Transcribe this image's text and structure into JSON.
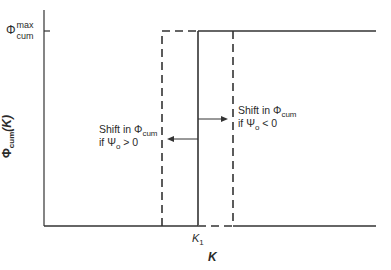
{
  "diagram": {
    "y_axis_label": {
      "symbol": "Φ",
      "subscript": "cum",
      "arg": "(K)"
    },
    "y_tick_label": {
      "symbol": "Φ",
      "superscript": "max",
      "subscript": "cum"
    },
    "x_axis_label": "K",
    "x_tick_label": {
      "symbol": "K",
      "subscript": "1"
    },
    "annotation_left": {
      "line1_prefix": "Shift in Φ",
      "line1_sub": "cum",
      "line2_prefix": "if Ψ",
      "line2_sub": "o",
      "line2_suffix": " > 0"
    },
    "annotation_right": {
      "line1_prefix": "Shift in Φ",
      "line1_sub": "cum",
      "line2_prefix": "if Ψ",
      "line2_sub": "o",
      "line2_suffix": " < 0"
    },
    "colors": {
      "line": "#2a2a2a",
      "background": "#ffffff"
    }
  }
}
